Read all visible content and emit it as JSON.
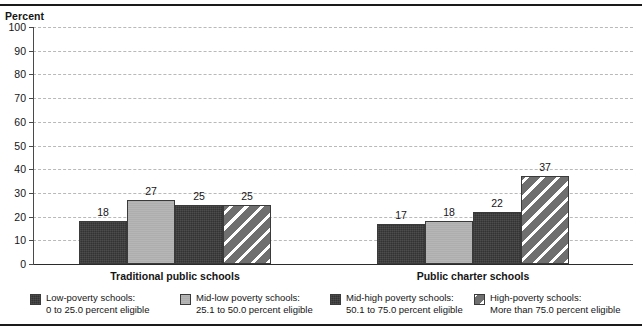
{
  "chart_data": {
    "type": "bar",
    "title": "",
    "xlabel": "",
    "ylabel": "Percent",
    "ylim": [
      0,
      100
    ],
    "ytick_step": 10,
    "yticks": [
      "100",
      "90",
      "80",
      "70",
      "60",
      "50",
      "40",
      "30",
      "20",
      "10",
      "0"
    ],
    "grid": "horizontal-dashed",
    "legend_position": "bottom",
    "categories": [
      "Traditional public schools",
      "Public charter schools"
    ],
    "series": [
      {
        "name": "Low-poverty schools: 0 to 25.0 percent eligible",
        "short_name": "Low-poverty schools:",
        "range_label": "0 to 25.0 percent eligible",
        "pattern": "solid-dark",
        "color": "#333333",
        "values": [
          18,
          17
        ],
        "value_labels": [
          "18",
          "17"
        ]
      },
      {
        "name": "Mid-low poverty schools: 25.1 to 50.0 percent eligible",
        "short_name": "Mid-low poverty schools:",
        "range_label": "25.1 to 50.0 percent eligible",
        "pattern": "solid-light",
        "color": "#aeaeae",
        "values": [
          27,
          18
        ],
        "value_labels": [
          "27",
          "18"
        ]
      },
      {
        "name": "Mid-high poverty schools: 50.1 to 75.0 percent eligible",
        "short_name": "Mid-high poverty schools:",
        "range_label": "50.1 to 75.0 percent eligible",
        "pattern": "solid-dark",
        "color": "#333333",
        "values": [
          25,
          22
        ],
        "value_labels": [
          "25",
          "22"
        ]
      },
      {
        "name": "High-poverty schools: More than 75.0 percent eligible",
        "short_name": "High-poverty schools:",
        "range_label": "More than 75.0 percent eligible",
        "pattern": "diagonal-hatch",
        "color": "#6f6f6f",
        "values": [
          25,
          37
        ],
        "value_labels": [
          "25",
          "37"
        ]
      }
    ]
  },
  "axis": {
    "percent_label": "Percent"
  },
  "legend": {
    "items": [
      {
        "line1": "Low-poverty schools:",
        "line2": "0 to 25.0 percent eligible",
        "pattern": "solid-dark"
      },
      {
        "line1": "Mid-low poverty schools:",
        "line2": "25.1 to 50.0 percent eligible",
        "pattern": "solid-light"
      },
      {
        "line1": "Mid-high poverty schools:",
        "line2": "50.1 to 75.0 percent eligible",
        "pattern": "solid-dark"
      },
      {
        "line1": "High-poverty schools:",
        "line2": "More than 75.0 percent eligible",
        "pattern": "diagonal-hatch"
      }
    ]
  }
}
